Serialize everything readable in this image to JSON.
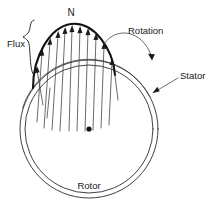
{
  "diagram": {
    "type": "schematic",
    "background_color": "#ffffff",
    "line_color": "#2b2b2b",
    "bold_line_color": "#111111",
    "labels": {
      "pole": "N",
      "flux": "Flux",
      "rotation": "Rotation",
      "stator": "Stator",
      "rotor": "Rotor"
    },
    "geometry": {
      "center_x": 89,
      "center_y": 129,
      "outer_radius": 69,
      "inner_radius": 64,
      "flux_peak_x": 71,
      "flux_peak_y": 24,
      "flux_left_x": 33,
      "flux_left_y": 88,
      "flux_right_x": 115,
      "flux_right_y": 75
    },
    "flux_arrow_count": 11,
    "annotations": [
      {
        "name": "pole-marker",
        "text": "N",
        "x": 71,
        "y": 13
      },
      {
        "name": "flux-label",
        "text": "Flux",
        "x": 8,
        "y": 44
      },
      {
        "name": "rotation-label",
        "text": "Rotation",
        "x": 127,
        "y": 32
      },
      {
        "name": "stator-label",
        "text": "Stator",
        "x": 168,
        "y": 86
      },
      {
        "name": "rotor-label",
        "text": "Rotor",
        "x": 89,
        "y": 186
      }
    ]
  }
}
